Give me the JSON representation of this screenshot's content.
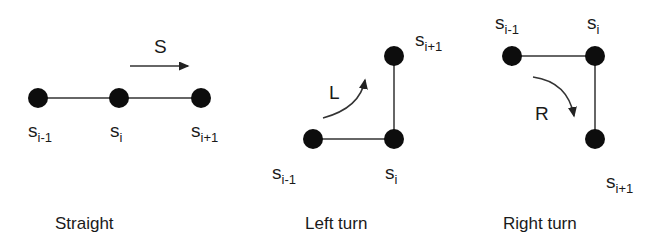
{
  "panels": [
    {
      "caption": "Straight",
      "direction_label": "S",
      "nodes": [
        {
          "base": "s",
          "sub": "i-1"
        },
        {
          "base": "s",
          "sub": "i"
        },
        {
          "base": "s",
          "sub": "i+1"
        }
      ]
    },
    {
      "caption": "Left turn",
      "direction_label": "L",
      "nodes": [
        {
          "base": "s",
          "sub": "i-1"
        },
        {
          "base": "s",
          "sub": "i"
        },
        {
          "base": "s",
          "sub": "i+1"
        }
      ]
    },
    {
      "caption": "Right turn",
      "direction_label": "R",
      "nodes": [
        {
          "base": "s",
          "sub": "i-1"
        },
        {
          "base": "s",
          "sub": "i"
        },
        {
          "base": "s",
          "sub": "i+1"
        }
      ]
    }
  ],
  "colors": {
    "node": "#0d0d0d",
    "line": "#333333",
    "text": "#1a1a1a"
  }
}
